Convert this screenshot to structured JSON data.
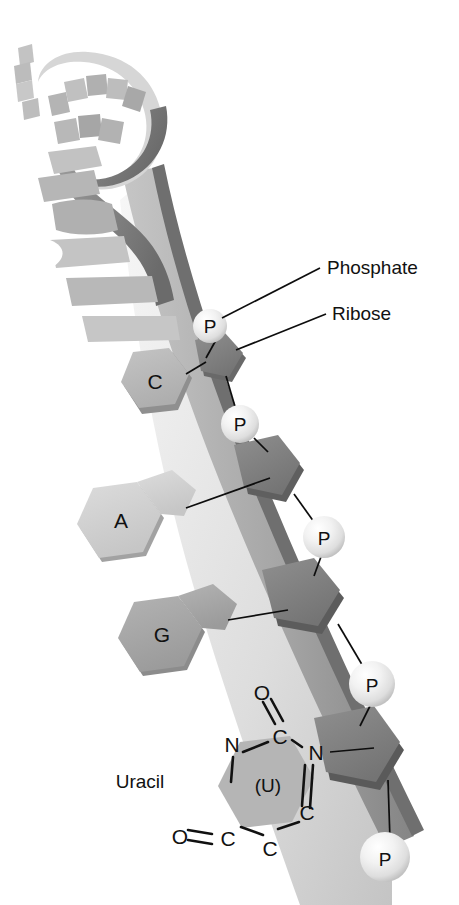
{
  "figure": {
    "background_color": "#ffffff"
  },
  "callouts": [
    {
      "id": "phosphate",
      "label": "Phosphate",
      "x": 327,
      "y": 274
    },
    {
      "id": "ribose",
      "label": "Ribose",
      "x": 332,
      "y": 320
    }
  ],
  "bases": [
    {
      "id": "cytosine",
      "letter": "C",
      "type": "pyrimidine",
      "color": "#b9b9b9",
      "x": 155,
      "y": 382
    },
    {
      "id": "adenine",
      "letter": "A",
      "type": "purine",
      "color": "#d2d2d2",
      "x": 122,
      "y": 520
    },
    {
      "id": "guanine",
      "letter": "G",
      "type": "purine",
      "color": "#a9a9a9",
      "x": 162,
      "y": 632
    }
  ],
  "phosphates": [
    {
      "id": "p1",
      "letter": "P",
      "x": 210,
      "y": 326
    },
    {
      "id": "p2",
      "letter": "P",
      "x": 240,
      "y": 424
    },
    {
      "id": "p3",
      "letter": "P",
      "x": 324,
      "y": 537
    },
    {
      "id": "p4",
      "letter": "P",
      "x": 372,
      "y": 684
    },
    {
      "id": "p5",
      "letter": "P",
      "x": 385,
      "y": 857
    }
  ],
  "uracil": {
    "name": "Uracil",
    "name_x": 140,
    "name_y": 788,
    "center_letter": "(U)",
    "ring_fill": "#b5b5b5",
    "atoms": [
      {
        "id": "n1",
        "symbol": "N",
        "x": 232,
        "y": 744
      },
      {
        "id": "c2",
        "symbol": "C",
        "x": 280,
        "y": 736
      },
      {
        "id": "n3",
        "symbol": "N",
        "x": 257,
        "y": 797
      },
      {
        "id": "c4",
        "symbol": "C",
        "x": 228,
        "y": 840
      },
      {
        "id": "c5",
        "symbol": "C",
        "x": 287,
        "y": 822
      },
      {
        "id": "c6",
        "symbol": "C",
        "x": 310,
        "y": 752
      },
      {
        "id": "o_top",
        "symbol": "O",
        "x": 216,
        "y": 709
      },
      {
        "id": "o_left",
        "symbol": "O",
        "x": 150,
        "y": 817
      }
    ]
  },
  "colors": {
    "backbone_ribbon": "#a8a8a8",
    "backbone_edge": "#6e6e6e",
    "backbone_inner": "#c9c9c9",
    "ribose_top": "#8a8a8a",
    "ribose_side": "#5f5f5f",
    "phosphate_sphere": "#ededed",
    "helix_light": "#cfcfcf",
    "helix_dark": "#7b7b7b",
    "line_color": "#0d0d0d"
  },
  "helix": {
    "description": "twisted RNA ribbon with projecting base paddles at top of figure",
    "paddle_count": 12
  }
}
